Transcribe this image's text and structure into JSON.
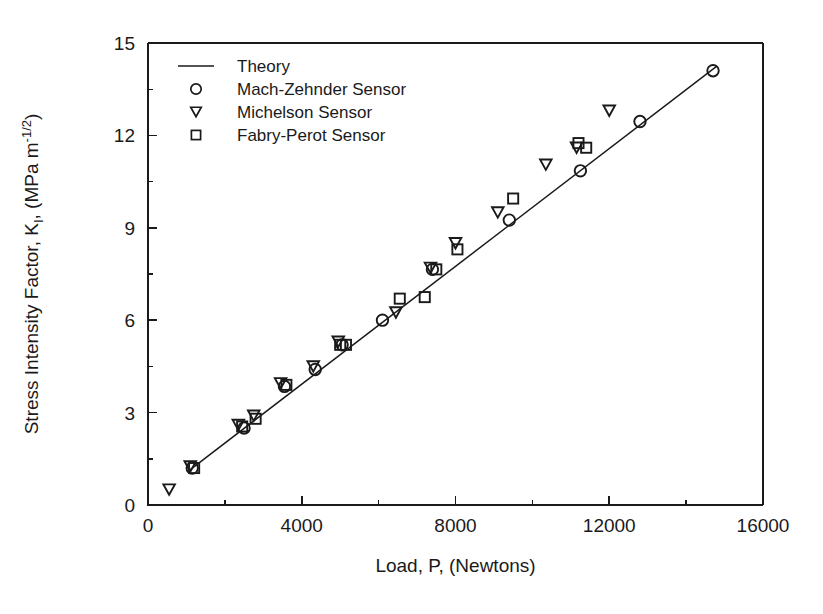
{
  "chart_data": {
    "type": "scatter",
    "title": "",
    "xlabel": "Load, P, (Newtons)",
    "ylabel_full": "Stress Intensity Factor, K<sub>I</sub>, (MPa m<sup>-1/2</sup>)",
    "ylabel_prefix": "Stress Intensity Factor, K",
    "ylabel_sub": "I",
    "ylabel_mid": ", (MPa m",
    "ylabel_sup": "-1/2",
    "ylabel_suffix": ")",
    "xlim": [
      0,
      16000
    ],
    "ylim": [
      0,
      15
    ],
    "xticks": [
      0,
      4000,
      8000,
      12000,
      16000
    ],
    "xtick_labels": [
      "0",
      "4000",
      "8000",
      "12000",
      "16000"
    ],
    "yticks": [
      0,
      3,
      6,
      9,
      12,
      15
    ],
    "ytick_labels": [
      "0",
      "3",
      "6",
      "9",
      "12",
      "15"
    ],
    "x_minor_ticks": [
      2000,
      6000,
      10000,
      14000
    ],
    "y_minor_ticks": [
      1.5,
      4.5,
      7.5,
      10.5,
      13.5
    ],
    "grid": false,
    "legend_position": "upper-left",
    "marker_color": "#1a1a1a",
    "line_color": "#1a1a1a",
    "background": "#ffffff",
    "series": [
      {
        "name": "Theory",
        "marker": "line",
        "type": "line",
        "x": [
          1100,
          14800
        ],
        "y": [
          1.15,
          14.25
        ]
      },
      {
        "name": "Mach-Zehnder Sensor",
        "marker": "circle",
        "type": "scatter",
        "points": [
          [
            1150,
            1.2
          ],
          [
            2500,
            2.5
          ],
          [
            3550,
            3.85
          ],
          [
            4350,
            4.4
          ],
          [
            5050,
            5.2
          ],
          [
            6100,
            6.0
          ],
          [
            7400,
            7.65
          ],
          [
            9400,
            9.25
          ],
          [
            11250,
            10.85
          ],
          [
            12800,
            12.45
          ],
          [
            14700,
            14.1
          ]
        ]
      },
      {
        "name": "Michelson Sensor",
        "marker": "triangle-down",
        "type": "scatter",
        "points": [
          [
            550,
            0.5
          ],
          [
            1100,
            1.25
          ],
          [
            2350,
            2.6
          ],
          [
            2750,
            2.9
          ],
          [
            3450,
            3.95
          ],
          [
            4300,
            4.5
          ],
          [
            4950,
            5.3
          ],
          [
            6450,
            6.25
          ],
          [
            7350,
            7.7
          ],
          [
            8000,
            8.5
          ],
          [
            9100,
            9.5
          ],
          [
            10350,
            11.05
          ],
          [
            11150,
            11.6
          ],
          [
            12000,
            12.8
          ]
        ]
      },
      {
        "name": "Fabry-Perot Sensor",
        "marker": "square",
        "type": "scatter",
        "points": [
          [
            1200,
            1.2
          ],
          [
            2450,
            2.55
          ],
          [
            2800,
            2.8
          ],
          [
            3600,
            3.9
          ],
          [
            5000,
            5.2
          ],
          [
            5150,
            5.2
          ],
          [
            6550,
            6.7
          ],
          [
            7200,
            6.75
          ],
          [
            7500,
            7.65
          ],
          [
            8050,
            8.3
          ],
          [
            9500,
            9.95
          ],
          [
            11200,
            11.75
          ],
          [
            11400,
            11.6
          ]
        ]
      }
    ],
    "legend_entries": [
      {
        "label": "Theory",
        "marker": "line"
      },
      {
        "label": "Mach-Zehnder Sensor",
        "marker": "circle"
      },
      {
        "label": "Michelson Sensor",
        "marker": "triangle-down"
      },
      {
        "label": "Fabry-Perot Sensor",
        "marker": "square"
      }
    ]
  }
}
